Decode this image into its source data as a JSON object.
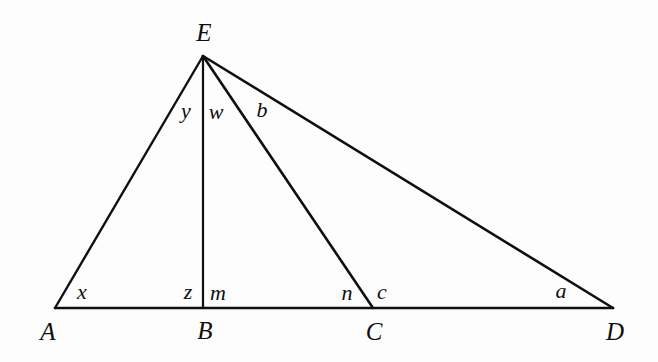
{
  "figure": {
    "kind": "geometry-diagram",
    "background_color": "#fdfdfd",
    "stroke_color": "#100f0f",
    "vertices": [
      {
        "id": "A",
        "label": "A",
        "x": 55,
        "y": 308,
        "label_x": 48,
        "label_y": 331
      },
      {
        "id": "B",
        "label": "B",
        "x": 203,
        "y": 308,
        "label_x": 205,
        "label_y": 330
      },
      {
        "id": "C",
        "label": "C",
        "x": 373,
        "y": 308,
        "label_x": 374,
        "label_y": 331
      },
      {
        "id": "D",
        "label": "D",
        "x": 613,
        "y": 308,
        "label_x": 615,
        "label_y": 331
      },
      {
        "id": "E",
        "label": "E",
        "x": 203,
        "y": 56,
        "label_x": 204,
        "label_y": 32
      }
    ],
    "segments": [
      {
        "id": "AD",
        "from": "A",
        "to": "D",
        "name": "baseline-AD"
      },
      {
        "id": "AE",
        "from": "A",
        "to": "E",
        "name": "segment-AE"
      },
      {
        "id": "EB",
        "from": "E",
        "to": "B",
        "name": "segment-EB"
      },
      {
        "id": "EC",
        "from": "E",
        "to": "C",
        "name": "segment-EC"
      },
      {
        "id": "ED",
        "from": "E",
        "to": "D",
        "name": "segment-ED"
      }
    ],
    "angle_labels": [
      {
        "id": "x",
        "label": "x",
        "x": 82,
        "y": 292,
        "at_vertex": "A"
      },
      {
        "id": "z",
        "label": "z",
        "x": 188,
        "y": 292,
        "at_vertex": "B"
      },
      {
        "id": "m",
        "label": "m",
        "x": 218,
        "y": 293,
        "at_vertex": "B"
      },
      {
        "id": "n",
        "label": "n",
        "x": 347,
        "y": 293,
        "at_vertex": "C"
      },
      {
        "id": "c",
        "label": "c",
        "x": 382,
        "y": 292,
        "at_vertex": "C"
      },
      {
        "id": "a",
        "label": "a",
        "x": 561,
        "y": 291,
        "at_vertex": "D"
      },
      {
        "id": "y",
        "label": "y",
        "x": 186,
        "y": 111,
        "at_vertex": "E"
      },
      {
        "id": "w",
        "label": "w",
        "x": 216,
        "y": 112,
        "at_vertex": "E"
      },
      {
        "id": "b",
        "label": "b",
        "x": 262,
        "y": 110,
        "at_vertex": "E"
      }
    ]
  }
}
